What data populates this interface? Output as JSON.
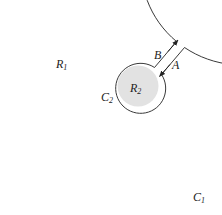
{
  "diagram": {
    "regions": [
      {
        "id": "R1",
        "label": "R",
        "sub": "1"
      },
      {
        "id": "R2",
        "label": "R",
        "sub": "2"
      }
    ],
    "contours": [
      {
        "id": "C1",
        "label": "C",
        "sub": "1"
      },
      {
        "id": "C2",
        "label": "C",
        "sub": "2"
      }
    ],
    "cut_paths": [
      {
        "id": "A",
        "label": "A",
        "direction": "inward"
      },
      {
        "id": "B",
        "label": "B",
        "direction": "outward"
      }
    ],
    "colors": {
      "stroke": "#222222",
      "fill_inner": "#e2e2e2",
      "background": "#ffffff"
    }
  }
}
